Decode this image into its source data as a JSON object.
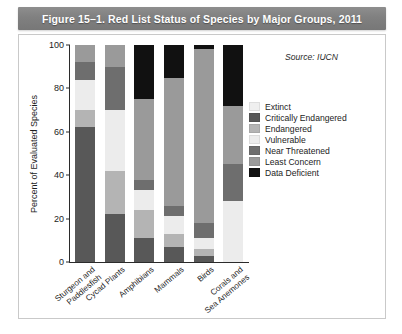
{
  "figure": {
    "title": "Figure 15–1. Red List Status of Species by Major Groups, 2011",
    "source_note": "Source: IUCN"
  },
  "chart_data": {
    "type": "bar",
    "stacked": true,
    "title": "Figure 15–1. Red List Status of Species by Major Groups, 2011",
    "subtitle": "",
    "xlabel": "",
    "ylabel": "Percent of Evaluated Species",
    "ylim": [
      0,
      100
    ],
    "yticks": [
      0,
      20,
      40,
      60,
      80,
      100
    ],
    "ytick_labels": [
      "0",
      "20",
      "40",
      "60",
      "80",
      "100"
    ],
    "grid": false,
    "legend_position": "right",
    "annotations": [
      "Source: IUCN"
    ],
    "categories": [
      "Sturgeon and Paddlesfish",
      "Cycad Plants",
      "Amphibians",
      "Mammals",
      "Birds",
      "Corals and Sea Anemones"
    ],
    "category_lines": [
      [
        "Sturgeon and",
        "Paddlesfish"
      ],
      [
        "Cycad Plants"
      ],
      [
        "Amphibians"
      ],
      [
        "Mammals"
      ],
      [
        "Birds"
      ],
      [
        "Corals and",
        "Sea Anemones"
      ]
    ],
    "series": [
      {
        "name": "Extinct",
        "color": "#efefef",
        "values": [
          0,
          0,
          0,
          0,
          0,
          0
        ]
      },
      {
        "name": "Critically Endangered",
        "color": "#585858",
        "values": [
          62,
          22,
          11,
          7,
          3,
          0
        ]
      },
      {
        "name": "Endangered",
        "color": "#b4b4b4",
        "values": [
          8,
          20,
          13,
          6,
          3,
          0
        ]
      },
      {
        "name": "Vulnerable",
        "color": "#ececec",
        "values": [
          14,
          28,
          9,
          8,
          5,
          28
        ]
      },
      {
        "name": "Near Threatened",
        "color": "#6e6e6e",
        "values": [
          8,
          20,
          5,
          5,
          7,
          17
        ]
      },
      {
        "name": "Least Concern",
        "color": "#9a9a9a",
        "values": [
          8,
          10,
          37,
          59,
          80,
          27
        ]
      },
      {
        "name": "Data Deficient",
        "color": "#111111",
        "values": [
          0,
          0,
          25,
          15,
          2,
          28
        ]
      }
    ]
  },
  "legend": {
    "entries": [
      {
        "label": "Extinct",
        "color": "#efefef"
      },
      {
        "label": "Critically Endangered",
        "color": "#585858"
      },
      {
        "label": "Endangered",
        "color": "#b4b4b4"
      },
      {
        "label": "Vulnerable",
        "color": "#ececec"
      },
      {
        "label": "Near Threatened",
        "color": "#6e6e6e"
      },
      {
        "label": "Least Concern",
        "color": "#9a9a9a"
      },
      {
        "label": "Data Deficient",
        "color": "#111111"
      }
    ]
  }
}
